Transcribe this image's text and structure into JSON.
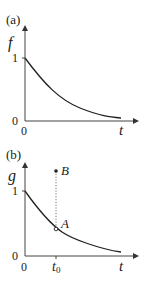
{
  "panel_a": {
    "label": "(a)",
    "y_axis_label": "f",
    "x_axis_label": "t",
    "y_tick_1": "1",
    "y_tick_0": "0",
    "x_tick_0": "0",
    "curve": "exponential decay from 1 toward 0"
  },
  "panel_b": {
    "label": "(b)",
    "y_axis_label": "g",
    "x_axis_label": "t",
    "y_tick_1": "1",
    "y_tick_0": "0",
    "x_tick_0": "0",
    "x_tick_t0": "t",
    "x_tick_t0_sub": "0",
    "point_a_label": "A",
    "point_b_label": "B",
    "curve": "exponential decay from 1 toward 0",
    "dotted_line": "vertical from A to B at t0"
  },
  "colors": {
    "ink": "#222222",
    "axis": "#444444",
    "dotted": "#777777"
  }
}
